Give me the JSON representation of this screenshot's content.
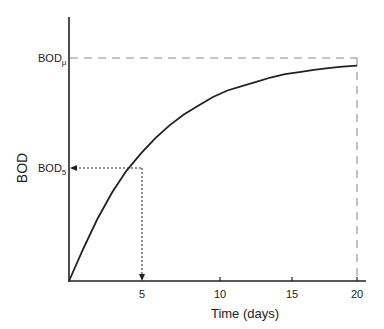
{
  "chart_data": {
    "type": "line",
    "title": "",
    "xlabel": "Time (days)",
    "ylabel": "BOD",
    "x_ticks": [
      5,
      10,
      15,
      20
    ],
    "xlim": [
      0,
      20
    ],
    "ylim": [
      0,
      1.08
    ],
    "grid": false,
    "legend": null,
    "series": [
      {
        "name": "BOD curve",
        "x": [
          0,
          1,
          2,
          3,
          4,
          5,
          6,
          7,
          8,
          9,
          10,
          11,
          12,
          13,
          14,
          15,
          16,
          17,
          18,
          19,
          20
        ],
        "y": [
          0,
          0.15,
          0.29,
          0.41,
          0.51,
          0.59,
          0.66,
          0.72,
          0.77,
          0.81,
          0.85,
          0.88,
          0.9,
          0.92,
          0.94,
          0.955,
          0.965,
          0.975,
          0.983,
          0.99,
          0.995
        ]
      }
    ],
    "annotations": [
      {
        "text": "BOD",
        "subscript": "μ",
        "type": "horizontal-dashed-reference",
        "y": 1.03,
        "note": "ultimate BOD"
      },
      {
        "text": "BOD",
        "subscript": "5",
        "type": "dotted-arrow-reference",
        "x": 5,
        "y": 0.59,
        "note": "5-day BOD"
      }
    ]
  },
  "labels": {
    "xlabel": "Time (days)",
    "ylabel": "BOD",
    "bod_u_main": "BOD",
    "bod_u_sub": "μ",
    "bod5_main": "BOD",
    "bod5_sub": "5",
    "ticks": [
      "5",
      "10",
      "15",
      "20"
    ]
  }
}
